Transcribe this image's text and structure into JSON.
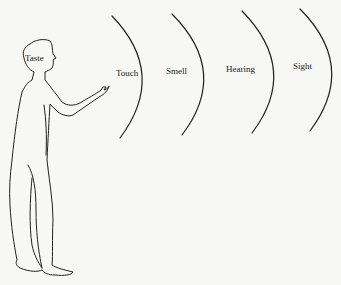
{
  "diagram": {
    "type": "sensory-range-illustration",
    "figure": "standing human outline facing right, hand extended",
    "labels": {
      "taste": "Taste",
      "touch": "Touch",
      "smell": "Smell",
      "hearing": "Hearing",
      "sight": "Sight"
    },
    "arc_count": 4,
    "line_color": "#222222",
    "background": "#f7f7f5"
  }
}
